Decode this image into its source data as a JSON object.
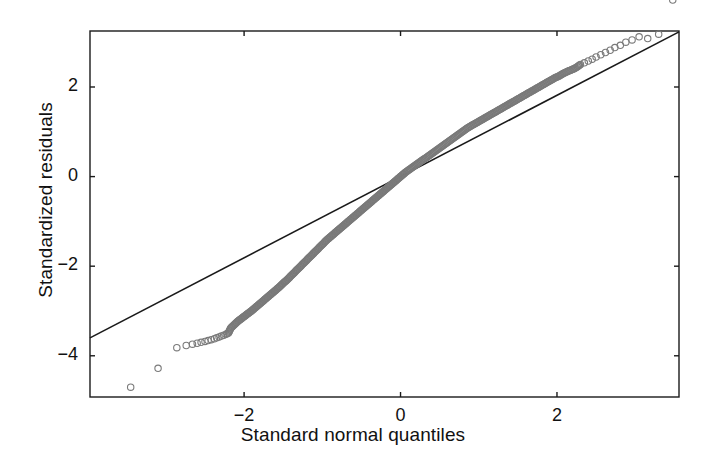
{
  "chart_data": {
    "type": "scatter",
    "title": "",
    "xlabel": "Standard normal quantiles",
    "ylabel": "Standardized residuals",
    "xlim": [
      -3.97,
      3.56
    ],
    "ylim": [
      -4.92,
      3.25
    ],
    "grid": false,
    "legend": null,
    "xticks": [
      -2,
      0,
      2
    ],
    "xticklabels": [
      "−2",
      "0",
      "2"
    ],
    "yticks": [
      2,
      0,
      -2,
      -4
    ],
    "yticklabels": [
      "2",
      "0",
      "−2",
      "−4"
    ],
    "marker": "open-circle",
    "marker_color": "#7a7a7a",
    "marker_size": 4,
    "reference_line": {
      "description": "45-degree normal reference line",
      "color": "#1a1a1a",
      "x": [
        -3.97,
        3.56
      ],
      "y": [
        -3.6,
        3.23
      ]
    },
    "series": [
      {
        "name": "Standardized residuals vs normal quantiles",
        "points_x": [
          -3.45,
          -3.1,
          -2.86,
          -2.74,
          -2.66,
          -2.6,
          -2.55,
          -2.5,
          -2.46,
          -2.42,
          -2.38,
          -2.35,
          -2.32,
          -2.29,
          -2.26,
          -2.23,
          -2.2,
          -2.17,
          -2.14,
          -2.11,
          -2.08,
          -2.05,
          -2.02,
          -1.99,
          -1.96,
          -1.93,
          -1.9,
          -1.86,
          -1.82,
          -1.78,
          -1.74,
          -1.7,
          -1.66,
          -1.62,
          -1.58,
          -1.54,
          -1.5,
          -1.46,
          -1.42,
          -1.38,
          -1.34,
          -1.3,
          -1.26,
          -1.22,
          -1.18,
          -1.14,
          -1.1,
          -1.06,
          -1.02,
          -0.98,
          -0.94,
          -0.9,
          -0.86,
          -0.82,
          -0.78,
          -0.74,
          -0.7,
          -0.66,
          -0.62,
          -0.58,
          -0.54,
          -0.5,
          -0.46,
          -0.42,
          -0.38,
          -0.34,
          -0.3,
          -0.26,
          -0.22,
          -0.18,
          -0.14,
          -0.1,
          -0.06,
          -0.02,
          0.02,
          0.06,
          0.1,
          0.14,
          0.18,
          0.22,
          0.26,
          0.3,
          0.34,
          0.38,
          0.42,
          0.46,
          0.5,
          0.54,
          0.58,
          0.62,
          0.66,
          0.7,
          0.74,
          0.78,
          0.82,
          0.86,
          0.9,
          0.94,
          0.98,
          1.02,
          1.06,
          1.1,
          1.14,
          1.18,
          1.22,
          1.26,
          1.3,
          1.34,
          1.38,
          1.42,
          1.46,
          1.5,
          1.54,
          1.58,
          1.62,
          1.66,
          1.7,
          1.74,
          1.78,
          1.82,
          1.86,
          1.9,
          1.94,
          1.98,
          2.02,
          2.06,
          2.1,
          2.14,
          2.18,
          2.22,
          2.26,
          2.3,
          2.35,
          2.4,
          2.45,
          2.5,
          2.56,
          2.62,
          2.68,
          2.74,
          2.81,
          2.88,
          2.96,
          3.05,
          3.16,
          3.3,
          3.48
        ],
        "points_y": [
          -4.7,
          -4.28,
          -3.82,
          -3.77,
          -3.74,
          -3.72,
          -3.7,
          -3.68,
          -3.66,
          -3.64,
          -3.62,
          -3.6,
          -3.58,
          -3.56,
          -3.54,
          -3.52,
          -3.49,
          -3.38,
          -3.33,
          -3.28,
          -3.23,
          -3.19,
          -3.15,
          -3.11,
          -3.07,
          -3.03,
          -2.99,
          -2.93,
          -2.87,
          -2.81,
          -2.75,
          -2.69,
          -2.63,
          -2.57,
          -2.51,
          -2.45,
          -2.38,
          -2.32,
          -2.25,
          -2.18,
          -2.11,
          -2.04,
          -1.97,
          -1.9,
          -1.83,
          -1.76,
          -1.69,
          -1.62,
          -1.55,
          -1.48,
          -1.41,
          -1.35,
          -1.29,
          -1.23,
          -1.17,
          -1.11,
          -1.05,
          -0.99,
          -0.93,
          -0.87,
          -0.81,
          -0.75,
          -0.69,
          -0.63,
          -0.57,
          -0.51,
          -0.45,
          -0.39,
          -0.33,
          -0.27,
          -0.21,
          -0.15,
          -0.09,
          -0.03,
          0.03,
          0.09,
          0.14,
          0.19,
          0.24,
          0.29,
          0.34,
          0.39,
          0.44,
          0.49,
          0.54,
          0.59,
          0.64,
          0.69,
          0.74,
          0.79,
          0.84,
          0.89,
          0.94,
          0.99,
          1.04,
          1.09,
          1.13,
          1.17,
          1.21,
          1.25,
          1.29,
          1.33,
          1.37,
          1.41,
          1.45,
          1.49,
          1.53,
          1.57,
          1.61,
          1.65,
          1.69,
          1.73,
          1.77,
          1.81,
          1.85,
          1.89,
          1.93,
          1.97,
          2.01,
          2.05,
          2.09,
          2.13,
          2.17,
          2.21,
          2.24,
          2.28,
          2.32,
          2.35,
          2.38,
          2.41,
          2.45,
          2.5,
          2.54,
          2.58,
          2.62,
          2.67,
          2.72,
          2.77,
          2.82,
          2.88,
          2.93,
          3.0,
          3.05,
          3.12,
          3.08,
          3.18
        ]
      }
    ]
  },
  "figure": {
    "xlabel": "Standard normal quantiles",
    "ylabel": "Standardized residuals",
    "xtick_labels": [
      "−2",
      "0",
      "2"
    ],
    "ytick_labels": [
      "2",
      "0",
      "−2",
      "−4"
    ],
    "background_color": "#ffffff",
    "frame_color": "#1a1a1a",
    "point_color": "#7a7a7a",
    "line_color": "#1a1a1a"
  }
}
